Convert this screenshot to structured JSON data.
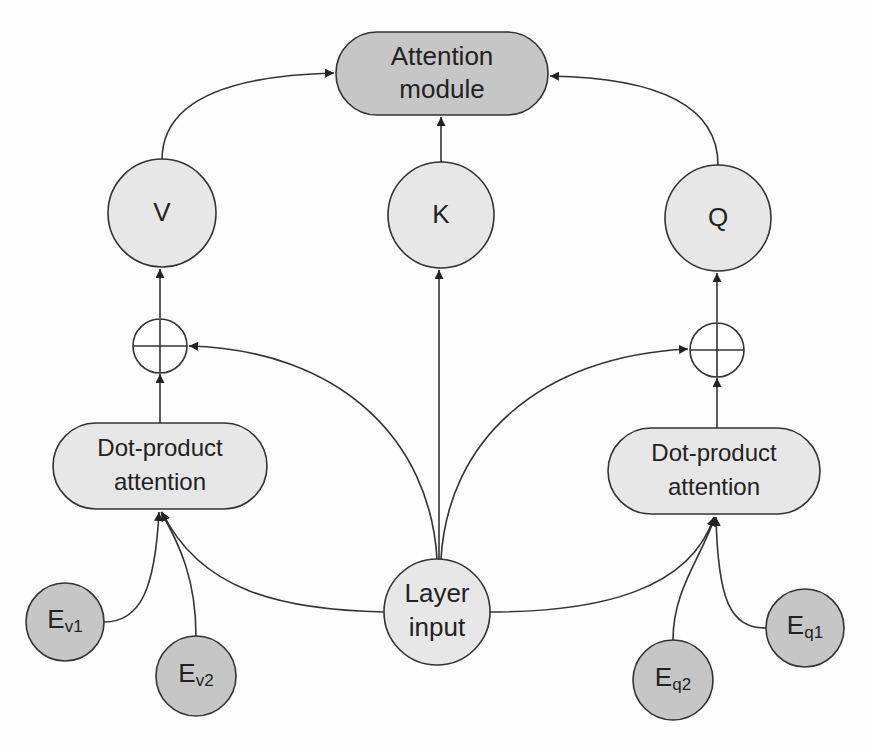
{
  "diagram": {
    "colors": {
      "dark_node_fill": "#c6c6c6",
      "light_node_fill": "#e7e7e7",
      "stroke": "#333333",
      "background": "#fdfdfd"
    },
    "nodes": {
      "attention_module": {
        "line1": "Attention",
        "line2": "module",
        "shape": "rounded-rect",
        "fill": "dark"
      },
      "v": {
        "label": "V",
        "shape": "circle",
        "fill": "light"
      },
      "k": {
        "label": "K",
        "shape": "circle",
        "fill": "light"
      },
      "q": {
        "label": "Q",
        "shape": "circle",
        "fill": "light"
      },
      "plus_left": {
        "label": "⊕",
        "shape": "circle-plus"
      },
      "plus_right": {
        "label": "⊕",
        "shape": "circle-plus"
      },
      "dot_left": {
        "line1": "Dot-product",
        "line2": "attention",
        "shape": "rounded-rect",
        "fill": "light"
      },
      "dot_right": {
        "line1": "Dot-product",
        "line2": "attention",
        "shape": "rounded-rect",
        "fill": "light"
      },
      "layer_input": {
        "line1": "Layer",
        "line2": "input",
        "shape": "circle",
        "fill": "light"
      },
      "ev1": {
        "main": "E",
        "sub": "v1",
        "shape": "circle",
        "fill": "dark"
      },
      "ev2": {
        "main": "E",
        "sub": "v2",
        "shape": "circle",
        "fill": "dark"
      },
      "eq1": {
        "main": "E",
        "sub": "q1",
        "shape": "circle",
        "fill": "dark"
      },
      "eq2": {
        "main": "E",
        "sub": "q2",
        "shape": "circle",
        "fill": "dark"
      }
    },
    "edges": [
      {
        "from": "v",
        "to": "attention_module"
      },
      {
        "from": "k",
        "to": "attention_module"
      },
      {
        "from": "q",
        "to": "attention_module"
      },
      {
        "from": "plus_left",
        "to": "v"
      },
      {
        "from": "plus_right",
        "to": "q"
      },
      {
        "from": "layer_input",
        "to": "plus_left"
      },
      {
        "from": "layer_input",
        "to": "k"
      },
      {
        "from": "layer_input",
        "to": "plus_right"
      },
      {
        "from": "dot_left",
        "to": "plus_left"
      },
      {
        "from": "dot_right",
        "to": "plus_right"
      },
      {
        "from": "ev1",
        "to": "dot_left"
      },
      {
        "from": "ev2",
        "to": "dot_left"
      },
      {
        "from": "layer_input",
        "to": "dot_left"
      },
      {
        "from": "eq1",
        "to": "dot_right"
      },
      {
        "from": "eq2",
        "to": "dot_right"
      },
      {
        "from": "layer_input",
        "to": "dot_right"
      }
    ]
  }
}
